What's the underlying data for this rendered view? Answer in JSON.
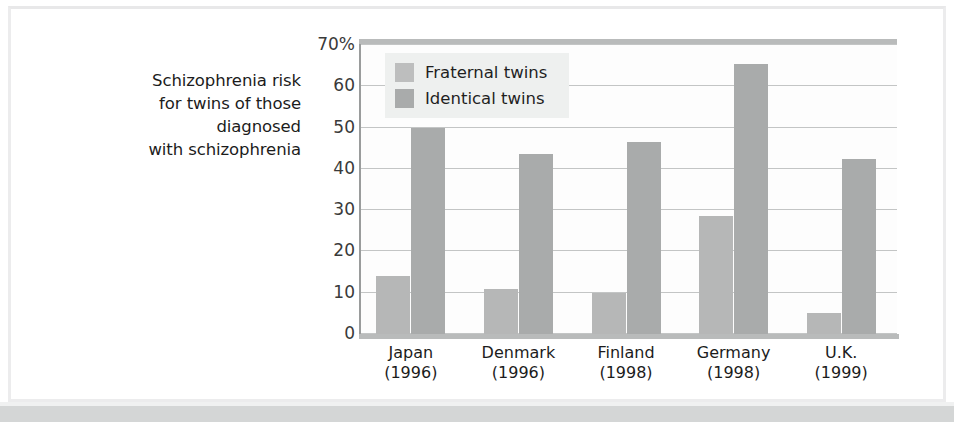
{
  "chart_data": {
    "type": "bar",
    "title": "Schizophrenia risk for twins of those diagnosed with schizophrenia",
    "title_lines": [
      "Schizophrenia risk",
      "for twins of those",
      "diagnosed",
      "with schizophrenia"
    ],
    "xlabel": "",
    "ylabel": "",
    "ylim": [
      0,
      70
    ],
    "grid": true,
    "legend_position": "top-left-inside",
    "ytick_labels": [
      "70%",
      "60",
      "50",
      "40",
      "30",
      "20",
      "10",
      "0"
    ],
    "ytick_values": [
      70,
      60,
      50,
      40,
      30,
      20,
      10,
      0
    ],
    "categories": [
      "Japan",
      "Denmark",
      "Finland",
      "Germany",
      "U.K."
    ],
    "category_years": [
      "(1996)",
      "(1996)",
      "(1998)",
      "(1998)",
      "(1999)"
    ],
    "series": [
      {
        "name": "Fraternal twins",
        "color": "#b6b7b7",
        "values": [
          14,
          11,
          10,
          28.5,
          5
        ]
      },
      {
        "name": "Identical twins",
        "color": "#a9abab",
        "values": [
          50,
          43.5,
          46.5,
          65.5,
          42.5
        ]
      }
    ]
  },
  "legend": {
    "items": [
      {
        "label": "Fraternal twins"
      },
      {
        "label": "Identical twins"
      }
    ]
  },
  "colors": {
    "fraternal": "#b6b7b7",
    "identical": "#a9abab",
    "grid": "#c3c5c5",
    "axis": "#9a9c9c",
    "band": "#d4d6d6"
  }
}
